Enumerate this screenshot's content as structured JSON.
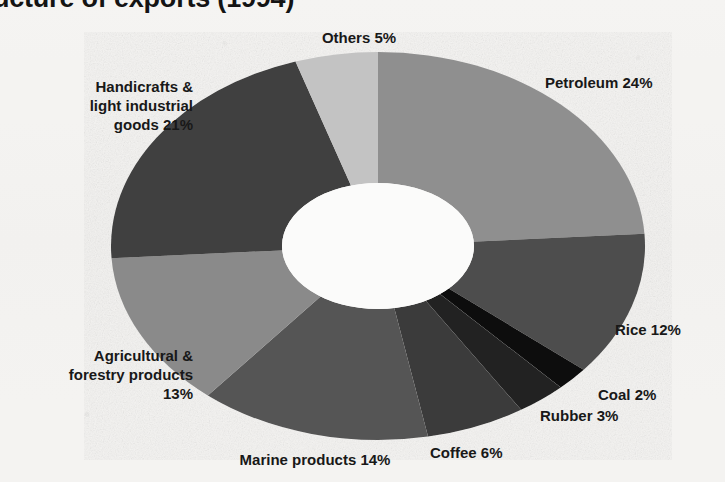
{
  "title": "Structure of exports (1994)",
  "chart_data": {
    "type": "pie",
    "variant": "donut",
    "title": "Structure of exports (1994)",
    "xlabel": "",
    "ylabel": "",
    "units": "percent",
    "total": 100,
    "start_angle_deg": 0,
    "direction": "clockwise",
    "legend": "none",
    "grid": false,
    "labels_position": "outside",
    "categories": [
      "Petroleum",
      "Rice",
      "Coal",
      "Rubber",
      "Coffee",
      "Marine products",
      "Agricultural & forestry products",
      "Handicrafts & light industrial goods",
      "Others"
    ],
    "values": [
      24,
      12,
      2,
      3,
      6,
      14,
      13,
      21,
      5
    ],
    "colors": [
      "#8f8f8f",
      "#4d4d4d",
      "#0d0d0d",
      "#222222",
      "#3a3a3a",
      "#555555",
      "#8a8a8a",
      "#3f3f3f",
      "#c3c3c3"
    ],
    "slices": [
      {
        "label": "Petroleum 24%",
        "name": "Petroleum",
        "value": 24,
        "color": "#8f8f8f"
      },
      {
        "label": "Rice 12%",
        "name": "Rice",
        "value": 12,
        "color": "#4d4d4d"
      },
      {
        "label": "Coal 2%",
        "name": "Coal",
        "value": 2,
        "color": "#0d0d0d"
      },
      {
        "label": "Rubber 3%",
        "name": "Rubber",
        "value": 3,
        "color": "#222222"
      },
      {
        "label": "Coffee 6%",
        "name": "Coffee",
        "value": 6,
        "color": "#3a3a3a"
      },
      {
        "label": "Marine products 14%",
        "name": "Marine products",
        "value": 14,
        "color": "#555555"
      },
      {
        "label": "Agricultural &\nforestry products\n13%",
        "name": "Agricultural & forestry products",
        "value": 13,
        "color": "#8a8a8a"
      },
      {
        "label": "Handicrafts &\nlight industrial\ngoods 21%",
        "name": "Handicrafts & light industrial goods",
        "value": 21,
        "color": "#3f3f3f"
      },
      {
        "label": "Others 5%",
        "name": "Others",
        "value": 5,
        "color": "#c3c3c3"
      }
    ]
  },
  "labels": {
    "petroleum": "Petroleum 24%",
    "rice": "Rice 12%",
    "coal": "Coal 2%",
    "rubber": "Rubber 3%",
    "coffee": "Coffee 6%",
    "marine": "Marine products 14%",
    "agricultural": "Agricultural &\nforestry products\n13%",
    "handicrafts": "Handicrafts &\nlight industrial\ngoods 21%",
    "others": "Others 5%"
  },
  "style": {
    "background": "#f4f3f1",
    "text_color": "#181818",
    "hole_color": "#fbfbfa"
  }
}
